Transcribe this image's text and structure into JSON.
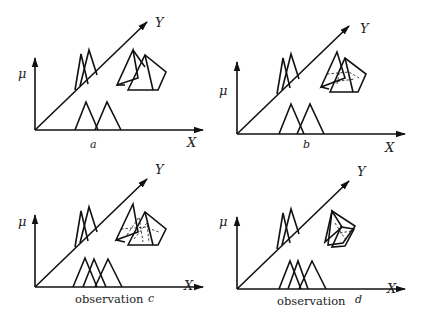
{
  "figure": {
    "panels": [
      {
        "id": "a",
        "caption": "a",
        "x_label": "X",
        "y_label": "Y",
        "mu_label": "μ",
        "observation_label": null,
        "bottom_triangles": 2,
        "relation_state": "two separate pyramids"
      },
      {
        "id": "b",
        "caption": "b",
        "x_label": "X",
        "y_label": "Y",
        "mu_label": "μ",
        "observation_label": null,
        "bottom_triangles": 2,
        "relation_state": "overlapping pyramids with dashed intersection"
      },
      {
        "id": "c",
        "caption": "c",
        "x_label": "X",
        "y_label": "Y",
        "mu_label": "μ",
        "observation_label": "observation",
        "bottom_triangles": 3,
        "relation_state": "pyramids cut by observation (dashed)"
      },
      {
        "id": "d",
        "caption": "d",
        "x_label": "X",
        "y_label": "Y",
        "mu_label": "μ",
        "observation_label": "observation",
        "bottom_triangles": 3,
        "relation_state": "shrunken pyramids after observation"
      }
    ]
  },
  "colors": {
    "ink": "#111111",
    "background": "#ffffff"
  }
}
